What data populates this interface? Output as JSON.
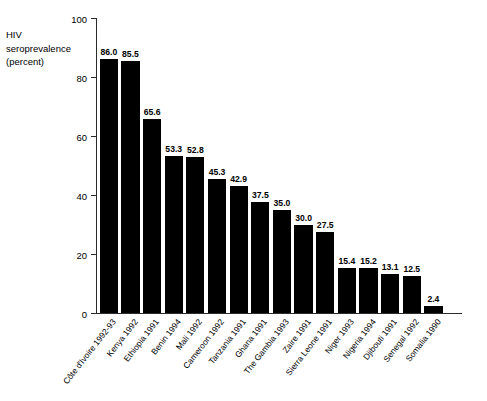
{
  "chart_data": {
    "type": "bar",
    "title": "",
    "xlabel": "",
    "ylabel": "HIV\nseroprevalence\n(percent)",
    "ylim": [
      0,
      100
    ],
    "yticks": [
      "0",
      "20",
      "40",
      "60",
      "80",
      "100"
    ],
    "ytick_values": [
      0,
      20,
      40,
      60,
      80,
      100
    ],
    "grid": false,
    "legend": "none",
    "bar_color": "#000000",
    "axis_color": "#2b2b2b",
    "categories": [
      "Côte d'Ivoire 1992-93",
      "Kenya 1992",
      "Ethiopia 1991",
      "Benin 1994",
      "Mali 1992",
      "Cameroon 1992",
      "Tanzania 1991",
      "Ghana 1991",
      "The Gambia 1993",
      "Zaire 1991",
      "Sierra Leone 1991",
      "Niger 1993",
      "Nigeria 1994",
      "Djibouti 1991",
      "Senegal 1992",
      "Somalia 1990"
    ],
    "values": [
      86.0,
      85.5,
      65.6,
      53.3,
      52.8,
      45.3,
      42.9,
      37.5,
      35.0,
      30.0,
      27.5,
      15.4,
      15.2,
      13.1,
      12.5,
      2.4
    ],
    "value_labels": [
      "86.0",
      "85.5",
      "65.6",
      "53.3",
      "52.8",
      "45.3",
      "42.9",
      "37.5",
      "35.0",
      "30.0",
      "27.5",
      "15.4",
      "15.2",
      "13.1",
      "12.5",
      "2.4"
    ]
  }
}
